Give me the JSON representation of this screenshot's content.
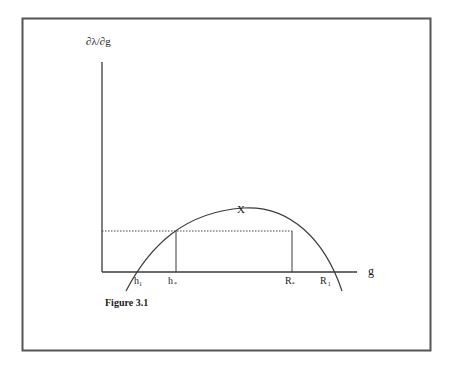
{
  "figure": {
    "caption": "Figure 3.1",
    "y_axis_label": "∂λ/∂g",
    "x_axis_label": "g",
    "peak_label": "X",
    "x_ticks": [
      {
        "base": "h",
        "sub": "1"
      },
      {
        "base": "h",
        "sub": "*"
      },
      {
        "base": "R",
        "sub": "*"
      },
      {
        "base": "R",
        "sub": "1"
      }
    ]
  },
  "colors": {
    "stroke": "#3a3a3a",
    "frame": "#555555",
    "background": "#ffffff"
  }
}
